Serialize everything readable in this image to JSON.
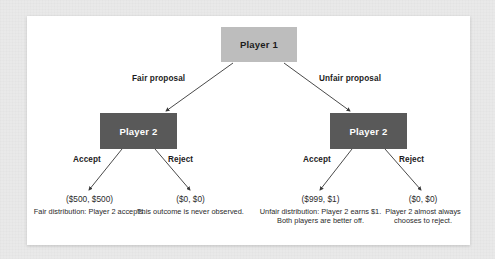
{
  "figure": {
    "type": "decision-tree",
    "panel_background": "#ffffff",
    "mat_background": "#e9e9e9"
  },
  "nodes": {
    "root": {
      "label": "Player 1",
      "fill": "#bdbdbd",
      "text_color": "#1c1c1c"
    },
    "left_branch": {
      "label": "Player 2",
      "fill": "#595959",
      "text_color": "#ffffff"
    },
    "right_branch": {
      "label": "Player 2",
      "fill": "#595959",
      "text_color": "#ffffff"
    }
  },
  "edges": {
    "fair": "Fair proposal",
    "unfair": "Unfair proposal",
    "left_accept": "Accept",
    "left_reject": "Reject",
    "right_accept": "Accept",
    "right_reject": "Reject"
  },
  "outcomes": [
    {
      "payoff": "($500, $500)",
      "description": "Fair distribution: Player 2 accepts."
    },
    {
      "payoff": "($0, $0)",
      "description": "This outcome is never observed."
    },
    {
      "payoff": "($999, $1)",
      "description": "Unfair distribution: Player 2 earns $1. Both players are better off."
    },
    {
      "payoff": "($0, $0)",
      "description": "Player 2 almost always chooses to reject."
    }
  ]
}
